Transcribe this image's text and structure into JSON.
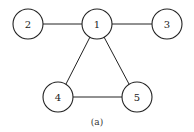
{
  "graph": {
    "nodes": [
      {
        "id": "1",
        "label": "1",
        "cx": 97,
        "cy": 24,
        "r": 15
      },
      {
        "id": "2",
        "label": "2",
        "cx": 28,
        "cy": 24,
        "r": 15
      },
      {
        "id": "3",
        "label": "3",
        "cx": 167,
        "cy": 24,
        "r": 15
      },
      {
        "id": "4",
        "label": "4",
        "cx": 58,
        "cy": 97,
        "r": 15
      },
      {
        "id": "5",
        "label": "5",
        "cx": 137,
        "cy": 97,
        "r": 15
      }
    ],
    "edges": [
      {
        "from": "1",
        "to": "2"
      },
      {
        "from": "1",
        "to": "3"
      },
      {
        "from": "1",
        "to": "4"
      },
      {
        "from": "1",
        "to": "5"
      },
      {
        "from": "4",
        "to": "5"
      }
    ]
  },
  "caption": "(a)"
}
